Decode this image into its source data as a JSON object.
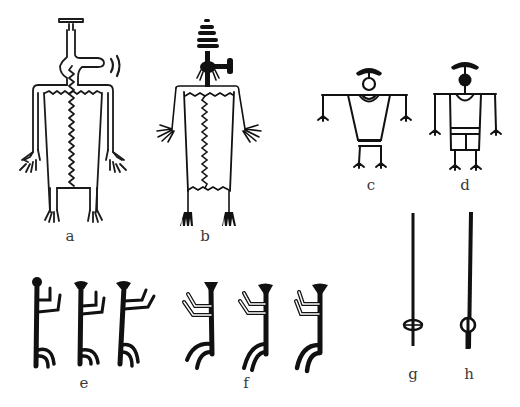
{
  "figure": {
    "ink_color": "#111111",
    "outline_color": "#1a1a1a",
    "background": "#ffffff",
    "panels": [
      {
        "id": "a",
        "label": "a",
        "kind": "outlined anthropomorph with bar headdress, side projection and zigzag midline",
        "label_pos": [
          70,
          232
        ]
      },
      {
        "id": "b",
        "label": "b",
        "kind": "anthropomorph with stacked-bar headdress, hammer projection and zigzag body",
        "label_pos": [
          205,
          234
        ]
      },
      {
        "id": "c",
        "label": "c",
        "kind": "stick anthropomorph with arc headdress, open circle head, belted tunic",
        "label_pos": [
          370,
          182
        ]
      },
      {
        "id": "d",
        "label": "d",
        "kind": "stick anthropomorph with arc headdress, solid circle head, belted tunic with kilt",
        "label_pos": [
          466,
          182
        ]
      },
      {
        "id": "e",
        "label": "e",
        "kind": "row of three solid stick figures with knob heads, arms raised right",
        "label_pos": [
          83,
          381
        ]
      },
      {
        "id": "f",
        "label": "f",
        "kind": "row of three solid stick figures with flared heads, arms raised left",
        "label_pos": [
          245,
          381
        ]
      },
      {
        "id": "g",
        "label": "g",
        "kind": "staff with open double loop",
        "label_pos": [
          413,
          374
        ]
      },
      {
        "id": "h",
        "label": "h",
        "kind": "staff with ring and inner bar",
        "label_pos": [
          469,
          374
        ]
      }
    ]
  }
}
